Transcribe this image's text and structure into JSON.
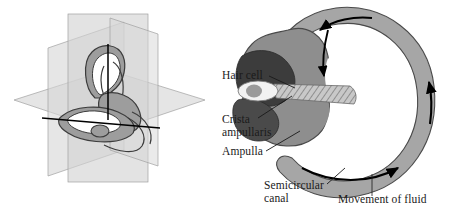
{
  "figure": {
    "background_color": "#ffffff"
  },
  "left_panel": {
    "name": "three-dimensional orientation of semicircular canals",
    "description": "Membranous labyrinth shown within three intersecting anatomical planes",
    "plane_color": "#d9d9d9",
    "plane_edge_color": "#9a9a9a",
    "axis_color": "#000000",
    "labyrinth_fill": "#9d9d9d",
    "labyrinth_outline": "#3a3a3a"
  },
  "right_panel": {
    "name": "ampulla cross section",
    "canal_fill": "#a6a6a6",
    "canal_outline": "#4a4a4a",
    "lumen_fill": "#ffffff",
    "crista_fill": "#3c3c3c",
    "ampulla_fill": "#8e8e8e",
    "cupula_fill": "#c8c8c8",
    "hair_cell_fill": "#f2f2f2",
    "hair_cell_core": "#9a9a9a",
    "arrow_color": "#000000"
  },
  "labels": {
    "hair_cell": "Hair cell",
    "crista_line1": "Crista",
    "crista_line2": "ampullaris",
    "ampulla": "Ampulla",
    "semicircular_line1": "Semicircular",
    "semicircular_line2": "canal",
    "movement_of_fluid": "Movement of fluid"
  },
  "arrows": {
    "top_canal": "counterclockwise fluid flow arrow along top of canal",
    "ampulla_down": "downward arrow into ampulla",
    "right_canal": "upward fluid flow arrow on right of canal",
    "bottom_canal": "rightward fluid flow arrow along bottom of canal"
  }
}
